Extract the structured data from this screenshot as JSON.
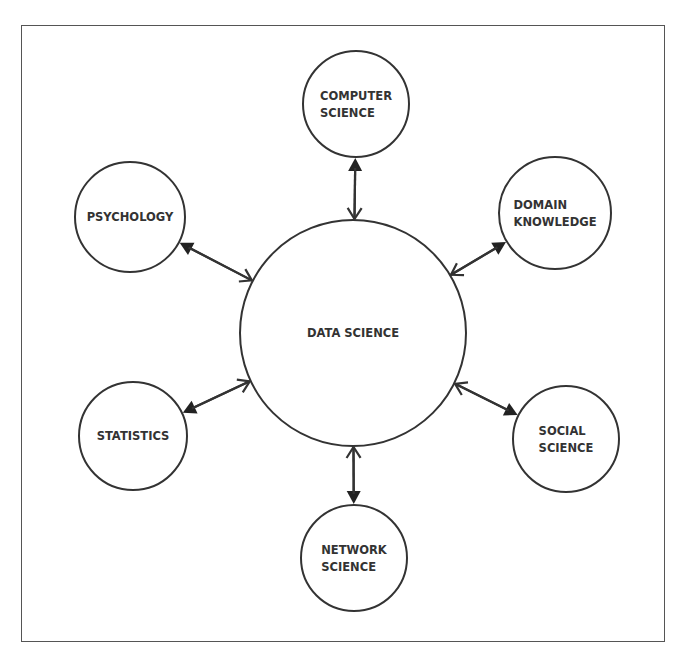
{
  "heading": {
    "text": "Key Diagram",
    "note": ""
  },
  "diagram": {
    "title": "",
    "stroke_color": "#333333",
    "background": "#ffffff",
    "center": {
      "id": "data-science",
      "lines": [
        "DATA SCIENCE"
      ],
      "cx": 353,
      "cy": 333,
      "r": 113
    },
    "nodes": [
      {
        "id": "computer-science",
        "lines": [
          "COMPUTER",
          "SCIENCE"
        ],
        "cx": 356,
        "cy": 104,
        "r": 53
      },
      {
        "id": "domain-knowledge",
        "lines": [
          "DOMAIN",
          "KNOWLEDGE"
        ],
        "cx": 555,
        "cy": 213,
        "r": 56
      },
      {
        "id": "social-science",
        "lines": [
          "SOCIAL",
          "SCIENCE"
        ],
        "cx": 566,
        "cy": 439,
        "r": 53
      },
      {
        "id": "network-science",
        "lines": [
          "NETWORK",
          "SCIENCE"
        ],
        "cx": 354,
        "cy": 558,
        "r": 53
      },
      {
        "id": "statistics",
        "lines": [
          "STATISTICS"
        ],
        "cx": 133,
        "cy": 436,
        "r": 54
      },
      {
        "id": "psychology",
        "lines": [
          "PSYCHOLOGY"
        ],
        "cx": 130,
        "cy": 217,
        "r": 55
      }
    ],
    "edges": [
      {
        "from": "data-science",
        "to": "computer-science",
        "type": "bidirectional"
      },
      {
        "from": "data-science",
        "to": "domain-knowledge",
        "type": "bidirectional"
      },
      {
        "from": "data-science",
        "to": "social-science",
        "type": "bidirectional"
      },
      {
        "from": "data-science",
        "to": "network-science",
        "type": "bidirectional"
      },
      {
        "from": "data-science",
        "to": "statistics",
        "type": "bidirectional"
      },
      {
        "from": "data-science",
        "to": "psychology",
        "type": "bidirectional"
      }
    ]
  }
}
